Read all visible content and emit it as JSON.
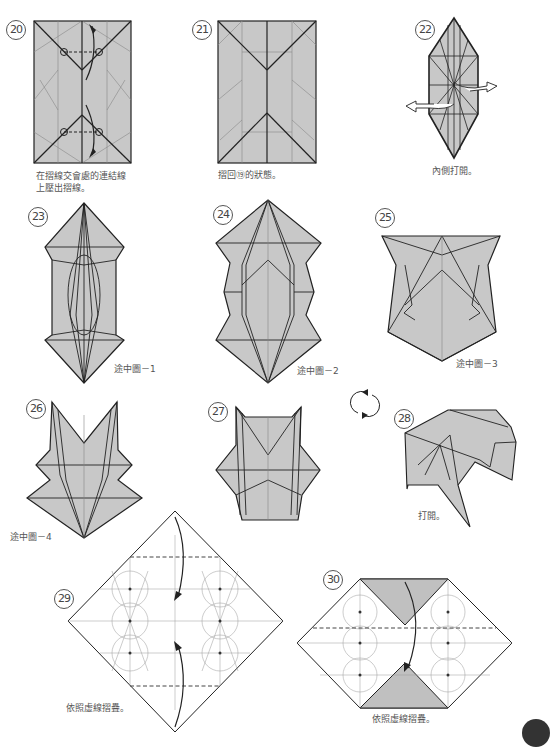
{
  "page": {
    "type": "origami folding instructions",
    "fill_color": "#c8c8c8",
    "line_color": "#222222",
    "crease_color": "#888888"
  },
  "steps": [
    {
      "number": "⑳",
      "label": "20",
      "caption_lines": [
        "在摺線交會處的連結線",
        "上壓出摺線。"
      ]
    },
    {
      "number": "㉑",
      "label": "21",
      "caption_lines": [
        "摺回⑲的狀態。"
      ]
    },
    {
      "number": "㉒",
      "label": "22",
      "caption_lines": [
        "內側打開。"
      ]
    },
    {
      "number": "㉓",
      "label": "23",
      "caption_lines": [
        "途中圖－1"
      ]
    },
    {
      "number": "㉔",
      "label": "24",
      "caption_lines": [
        "途中圖－2"
      ]
    },
    {
      "number": "㉕",
      "label": "25",
      "caption_lines": [
        "途中圖－3"
      ]
    },
    {
      "number": "㉖",
      "label": "26",
      "caption_lines": [
        "途中圖－4"
      ]
    },
    {
      "number": "㉗",
      "label": "27",
      "caption_lines": []
    },
    {
      "number": "㉘",
      "label": "28",
      "caption_lines": [
        "打開。"
      ]
    },
    {
      "number": "㉙",
      "label": "29",
      "caption_lines": [
        "依照虛線摺疊。"
      ]
    },
    {
      "number": "㉚",
      "label": "30",
      "caption_lines": [
        "依照虛線摺疊。"
      ]
    }
  ],
  "symbols": {
    "turn_over": "rotate-arrows-icon"
  }
}
